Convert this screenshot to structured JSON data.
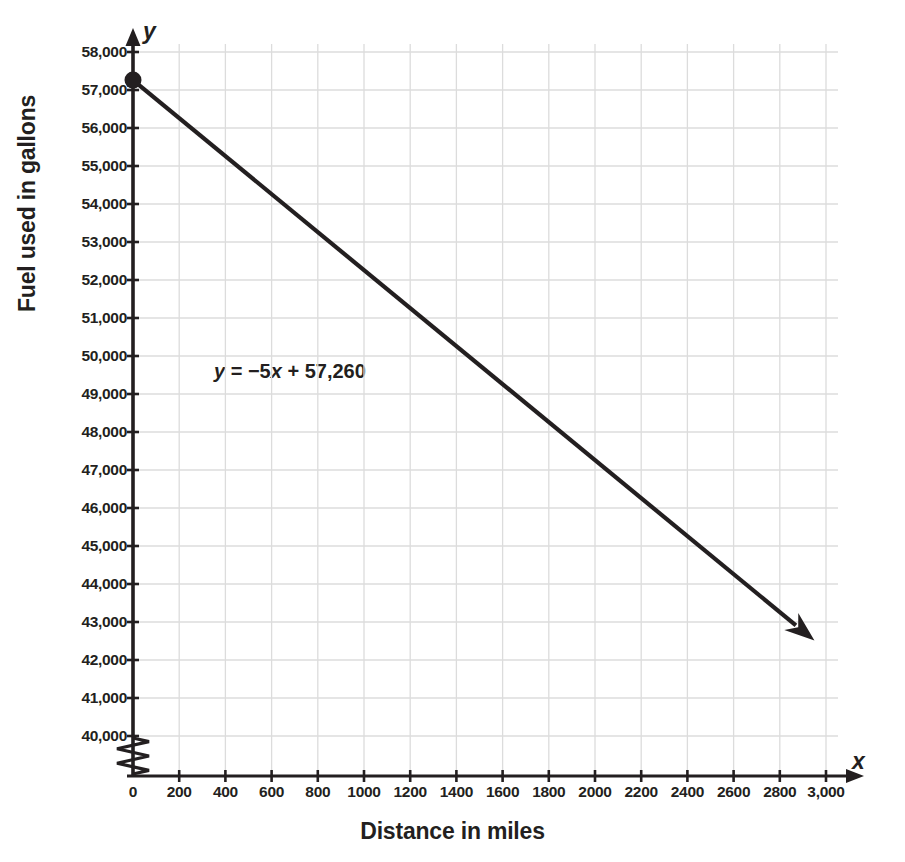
{
  "chart_data": {
    "type": "line",
    "title": "",
    "xlabel": "Distance in miles",
    "ylabel": "Fuel used in gallons",
    "xlim": [
      0,
      3000
    ],
    "ylim": [
      40000,
      58000
    ],
    "grid": true,
    "legend": "none",
    "y_axis_break": true,
    "annotation": {
      "text": "y = −5x + 57,260",
      "parts": {
        "y": "y",
        "eq": " = −5",
        "x": "x",
        "rest": " + 57,260"
      },
      "x": 1050,
      "y": 50000
    },
    "xticks": [
      0,
      200,
      400,
      600,
      800,
      1000,
      1200,
      1400,
      1600,
      1800,
      2000,
      2200,
      2400,
      2600,
      2800,
      3000
    ],
    "xtick_labels": [
      "0",
      "200",
      "400",
      "600",
      "800",
      "1000",
      "1200",
      "1400",
      "1600",
      "1800",
      "2000",
      "2200",
      "2400",
      "2600",
      "2800",
      "3,000"
    ],
    "yticks": [
      40000,
      41000,
      42000,
      43000,
      44000,
      45000,
      46000,
      47000,
      48000,
      49000,
      50000,
      51000,
      52000,
      53000,
      54000,
      55000,
      56000,
      57000,
      58000
    ],
    "ytick_labels": [
      "40,000",
      "41,000",
      "42,000",
      "43,000",
      "44,000",
      "45,000",
      "46,000",
      "47,000",
      "48,000",
      "49,000",
      "50,000",
      "51,000",
      "52,000",
      "53,000",
      "54,000",
      "55,000",
      "56,000",
      "57,000",
      "58,000"
    ],
    "series": [
      {
        "name": "Fuel remaining",
        "equation": "y = -5x + 57260",
        "slope": -5,
        "intercept": 57260,
        "x": [
          0,
          2950
        ],
        "values": [
          57260,
          42510
        ],
        "marker_points": [
          {
            "x": 0,
            "y": 57260
          }
        ],
        "arrow_end": true,
        "color": "#231f20"
      }
    ],
    "axis_letters": {
      "x": "x",
      "y": "y"
    },
    "colors": {
      "line": "#231f20",
      "grid": "#dcdcdc",
      "axis": "#231f20",
      "text": "#231f20",
      "background": "#ffffff"
    }
  }
}
